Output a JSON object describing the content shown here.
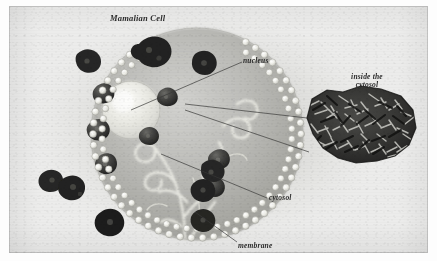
{
  "figure": {
    "title": "Mamalian Cell",
    "kind": "scanned-biology-diagram",
    "background_color": "#ececeb",
    "ink_color": "#2b2b2b"
  },
  "labels": {
    "title": "Mamalian Cell",
    "nucleus": "nucleus",
    "inset_title": "inside the\ncytosol",
    "cytosol": "cytosol",
    "membrane": "membrane"
  },
  "diagram": {
    "cell": {
      "name": "mammalian cell body",
      "shape": "circle",
      "fill_color": "#b9b9b6",
      "membrane_style": "phospholipid-bilayer-beads",
      "bead_color": "#f2f2ee",
      "bead_count": 116
    },
    "nucleus": {
      "name": "nucleus",
      "shape": "sphere",
      "fill_color": "#e9e9e4",
      "highlight_color": "#fbfbf8"
    },
    "organelles": {
      "name": "cytosolic organelles / protein clusters",
      "color": "#3a3a38",
      "count": 12
    },
    "membrane_proteins": {
      "name": "embedded membrane proteins",
      "color": "#2f2f2e",
      "count": 8
    },
    "cytoskeleton": {
      "name": "cytoskeletal filaments",
      "color": "#efefe8",
      "description": "pale curling tendrils rising from the cell base"
    },
    "inset": {
      "name": "magnified cytosol",
      "description": "dense crowded mass of macromolecules and filaments",
      "color": "#2a2a29"
    },
    "leader_lines": {
      "color": "#3c3c3a",
      "count": 5
    }
  }
}
